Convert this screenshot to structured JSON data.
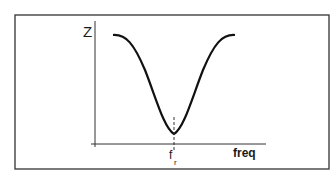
{
  "diagram": {
    "title": "",
    "y_axis_label": "Z",
    "x_axis_label": "freq",
    "marker_label": "f",
    "marker_subscript": "r"
  },
  "colors": {
    "background": "#ffffff",
    "stroke": "#1a1a1a",
    "frame": "#333333"
  }
}
